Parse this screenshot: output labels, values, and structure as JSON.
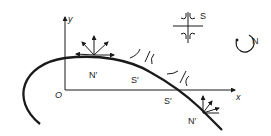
{
  "diagram": {
    "axes": {
      "x_label": "x",
      "y_label": "y",
      "origin_label": "O"
    },
    "curve_labels": [
      {
        "id": "n-prime-top",
        "text": "N′"
      },
      {
        "id": "s-prime-mid",
        "text": "S′"
      },
      {
        "id": "s-prime-axis",
        "text": "S′"
      },
      {
        "id": "n-prime-bottom",
        "text": "N′"
      }
    ],
    "legend": [
      {
        "id": "saddle",
        "text": "S"
      },
      {
        "id": "node",
        "text": "N"
      }
    ],
    "colors": {
      "ink": "#1a1a1a",
      "background": "#ffffff"
    }
  }
}
